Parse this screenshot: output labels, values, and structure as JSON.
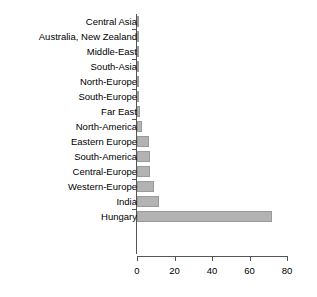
{
  "chart_data": {
    "type": "bar",
    "orientation": "horizontal",
    "title": "",
    "subtitle": "",
    "xlabel": "",
    "ylabel": "",
    "categories": [
      "Central Asia",
      "Australia, New Zealand",
      "Middle-East",
      "South-Asia",
      "North-Europe",
      "South-Europe",
      "Far East",
      "North-America",
      "Eastern Europe",
      "South-America",
      "Central-Europe",
      "Western-Europe",
      "India",
      "Hungary"
    ],
    "values": [
      0,
      0.1,
      0.4,
      0.5,
      0.6,
      0.7,
      1.8,
      2.4,
      6.5,
      7,
      7,
      9,
      11.5,
      72
    ],
    "xlim": [
      0,
      80
    ],
    "xticks": [
      0,
      20,
      40,
      60,
      80
    ],
    "xtick_labels": [
      "0",
      "20",
      "40",
      "60",
      "80"
    ],
    "grid": false,
    "legend": null,
    "bar_color": "#b3b3b3",
    "bar_edge_color": "#9a9a9a",
    "axis_color": "#555555",
    "background_color": "#ffffff"
  }
}
